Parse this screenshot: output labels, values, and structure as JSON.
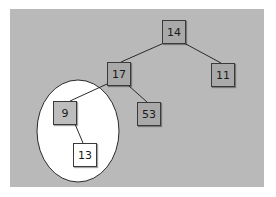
{
  "diagram": {
    "type": "binary-tree",
    "background_color": "#b9b9b9",
    "highlight": {
      "shape": "ellipse",
      "fill": "#ffffff",
      "encloses": [
        "9",
        "13"
      ]
    },
    "nodes": [
      {
        "id": "n14",
        "label": "14",
        "fill": "#a9a9a9"
      },
      {
        "id": "n17",
        "label": "17",
        "fill": "#a9a9a9"
      },
      {
        "id": "n11",
        "label": "11",
        "fill": "#a9a9a9"
      },
      {
        "id": "n53",
        "label": "53",
        "fill": "#a9a9a9"
      },
      {
        "id": "n9",
        "label": "9",
        "fill": "#bdbdbd"
      },
      {
        "id": "n13",
        "label": "13",
        "fill": "#ffffff"
      }
    ],
    "edges": [
      {
        "from": "14",
        "to": "17"
      },
      {
        "from": "14",
        "to": "11"
      },
      {
        "from": "17",
        "to": "9"
      },
      {
        "from": "17",
        "to": "53"
      },
      {
        "from": "9",
        "to": "13"
      }
    ]
  }
}
